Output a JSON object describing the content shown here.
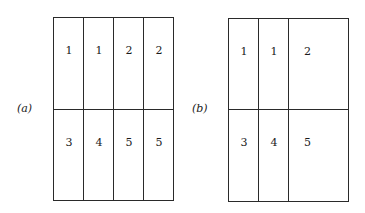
{
  "figure": {
    "panels": [
      {
        "label": "(a)",
        "rows": 2,
        "columns": 4,
        "cells": [
          {
            "row": 0,
            "col": 0,
            "colspan": 1,
            "value": "1"
          },
          {
            "row": 0,
            "col": 1,
            "colspan": 1,
            "value": "1"
          },
          {
            "row": 0,
            "col": 2,
            "colspan": 1,
            "value": "2"
          },
          {
            "row": 0,
            "col": 3,
            "colspan": 1,
            "value": "2"
          },
          {
            "row": 1,
            "col": 0,
            "colspan": 1,
            "value": "3"
          },
          {
            "row": 1,
            "col": 1,
            "colspan": 1,
            "value": "4"
          },
          {
            "row": 1,
            "col": 2,
            "colspan": 1,
            "value": "5"
          },
          {
            "row": 1,
            "col": 3,
            "colspan": 1,
            "value": "5"
          }
        ]
      },
      {
        "label": "(b)",
        "rows": 2,
        "columns": 4,
        "cells": [
          {
            "row": 0,
            "col": 0,
            "colspan": 1,
            "value": "1"
          },
          {
            "row": 0,
            "col": 1,
            "colspan": 1,
            "value": "1"
          },
          {
            "row": 0,
            "col": 2,
            "colspan": 2,
            "value": "2"
          },
          {
            "row": 1,
            "col": 0,
            "colspan": 1,
            "value": "3"
          },
          {
            "row": 1,
            "col": 1,
            "colspan": 1,
            "value": "4"
          },
          {
            "row": 1,
            "col": 2,
            "colspan": 2,
            "value": "5"
          }
        ]
      }
    ]
  }
}
